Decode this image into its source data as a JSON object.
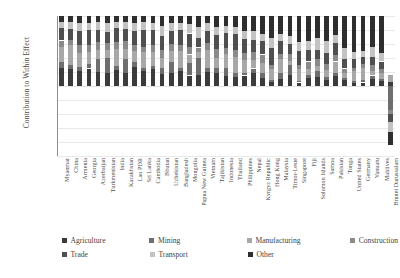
{
  "chart_data": {
    "type": "bar",
    "title": "",
    "xlabel": "",
    "ylabel": "Contribution to Within Effect",
    "ylim": [
      -100,
      100
    ],
    "ytick_labels": [
      "100%",
      "80%",
      "60%",
      "40%",
      "20%",
      "0%",
      "-20%",
      "-40%",
      "-60%",
      "-80%",
      "-100%"
    ],
    "ytick_values": [
      100,
      80,
      60,
      40,
      20,
      0,
      -20,
      -40,
      -60,
      -80,
      -100
    ],
    "grid": true,
    "stacked": true,
    "legend_position": "bottom",
    "legend": [
      "Agriculture",
      "Mining",
      "Manufacturing",
      "Construction",
      "Trade",
      "Transport",
      "Other"
    ],
    "colors": {
      "Agriculture": "#3b3b3b",
      "Mining": "#6e6e6e",
      "Manufacturing": "#a8a8a8",
      "Construction": "#8a8a8a",
      "Trade": "#4f4f4f",
      "Transport": "#c3c3c3",
      "Other": "#2e2e2e"
    },
    "categories": [
      "Myanmar",
      "China",
      "Armenia",
      "Georgia",
      "Azerbaijan",
      "Turkmenistan",
      "India",
      "Kazakhstan",
      "Lao PDR",
      "Sri Lanka",
      "Cambodia",
      "Bhutan",
      "Uzbekistan",
      "Bangladesh",
      "Mongolia",
      "Papua New Guinea",
      "Vietnam",
      "Tajikistan",
      "Indonesia",
      "Thailand",
      "Philippines",
      "Nepal",
      "Kyrgyz Republic",
      "Hong Kong",
      "Malaysia",
      "Timor-Leste",
      "Singapore",
      "Fiji",
      "Solomon Islands",
      "Samoa",
      "Pakistan",
      "Tonga",
      "United States",
      "Germany",
      "Vanuatu",
      "Maldives",
      "Brunei Darussalam"
    ],
    "series": [
      {
        "name": "Agriculture",
        "values": [
          26,
          24,
          22,
          25,
          20,
          18,
          23,
          19,
          27,
          21,
          24,
          17,
          19,
          22,
          15,
          16,
          20,
          18,
          14,
          13,
          15,
          19,
          12,
          6,
          10,
          16,
          5,
          11,
          13,
          9,
          14,
          8,
          4,
          5,
          10,
          7,
          6
        ]
      },
      {
        "name": "Mining",
        "values": [
          8,
          6,
          5,
          7,
          18,
          22,
          6,
          20,
          7,
          5,
          4,
          9,
          16,
          4,
          18,
          24,
          6,
          8,
          12,
          5,
          4,
          6,
          7,
          2,
          8,
          14,
          2,
          5,
          9,
          4,
          5,
          3,
          3,
          3,
          5,
          3,
          -34
        ]
      },
      {
        "name": "Manufacturing",
        "values": [
          22,
          28,
          20,
          16,
          14,
          12,
          24,
          14,
          16,
          22,
          20,
          14,
          15,
          24,
          12,
          8,
          26,
          14,
          20,
          24,
          18,
          12,
          14,
          16,
          20,
          6,
          18,
          9,
          7,
          10,
          16,
          7,
          14,
          18,
          6,
          8,
          10
        ]
      },
      {
        "name": "Construction",
        "values": [
          9,
          8,
          12,
          10,
          11,
          9,
          10,
          11,
          9,
          8,
          10,
          12,
          10,
          9,
          11,
          7,
          9,
          13,
          8,
          9,
          10,
          11,
          12,
          6,
          8,
          10,
          5,
          10,
          9,
          8,
          9,
          7,
          5,
          6,
          9,
          7,
          -6
        ]
      },
      {
        "name": "Trade",
        "values": [
          18,
          16,
          20,
          22,
          17,
          16,
          20,
          18,
          19,
          24,
          22,
          20,
          18,
          21,
          19,
          14,
          18,
          20,
          22,
          23,
          20,
          18,
          19,
          24,
          18,
          14,
          20,
          16,
          14,
          16,
          17,
          13,
          12,
          10,
          12,
          10,
          -12
        ]
      },
      {
        "name": "Transport",
        "values": [
          9,
          10,
          11,
          10,
          12,
          13,
          9,
          10,
          12,
          11,
          10,
          14,
          12,
          10,
          13,
          16,
          11,
          12,
          10,
          11,
          12,
          13,
          11,
          14,
          10,
          12,
          13,
          14,
          16,
          18,
          12,
          16,
          10,
          8,
          14,
          12,
          -14
        ]
      },
      {
        "name": "Other",
        "values": [
          8,
          8,
          10,
          10,
          8,
          10,
          8,
          8,
          10,
          9,
          10,
          14,
          10,
          10,
          12,
          15,
          10,
          15,
          14,
          15,
          21,
          21,
          25,
          32,
          26,
          28,
          37,
          35,
          32,
          35,
          27,
          46,
          52,
          50,
          44,
          53,
          -19
        ]
      }
    ]
  }
}
